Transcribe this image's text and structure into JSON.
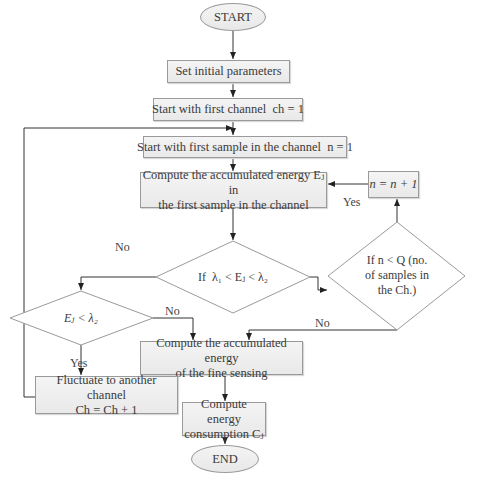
{
  "flowchart": {
    "start": "START",
    "end": "END",
    "set_params": "Set initial parameters",
    "first_channel": "Start with first channel  ch = 1",
    "first_sample": "Start with first sample in the channel  n = 1",
    "compute_ej_line1": "Compute the accumulated energy Eⱼ in",
    "compute_ej_line2": "the first sample in the channel",
    "increment_n": "n = n + 1",
    "decision_lambda": "If  λ₁ < Eⱼ < λ₂",
    "decision_nq_line1": "If n < Q (no.",
    "decision_nq_line2": "of samples in",
    "decision_nq_line3": "the Ch.)",
    "decision_ej": "Eⱼ < λ₂",
    "fine_sensing_line1": "Compute the accumulated energy",
    "fine_sensing_line2": "of the fine sensing",
    "fluctuate_line1": "Fluctuate to another channel",
    "fluctuate_line2": "Ch = Ch + 1",
    "consumption_line1": "Compute energy",
    "consumption_line2": "consumption Cⱼ",
    "labels": {
      "yes_loop": "Yes",
      "no_lambda": "No",
      "no_ej": "No",
      "no_nq": "No",
      "yes_ej": "Yes"
    }
  }
}
